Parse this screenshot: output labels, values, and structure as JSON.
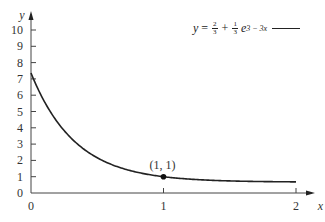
{
  "chart_data": {
    "type": "line",
    "title": "",
    "xlabel": "x",
    "ylabel": "y",
    "xlim": [
      0,
      2
    ],
    "ylim": [
      0,
      10
    ],
    "x_ticks": [
      "0",
      "1",
      "2"
    ],
    "y_ticks": [
      "0",
      "1",
      "2",
      "3",
      "4",
      "5",
      "6",
      "7",
      "8",
      "9",
      "10"
    ],
    "grid": false,
    "legend_position": "top-right",
    "series": [
      {
        "name": "y = 2/3 + 1/3 e^(3 - 3x)",
        "x": [
          0,
          0.1,
          0.2,
          0.3,
          0.4,
          0.5,
          0.6,
          0.7,
          0.8,
          0.9,
          1.0,
          1.2,
          1.4,
          1.6,
          1.8,
          2.0
        ],
        "values": [
          7.36,
          5.63,
          4.34,
          3.38,
          2.67,
          2.16,
          1.73,
          1.47,
          1.27,
          1.12,
          1.0,
          0.85,
          0.77,
          0.72,
          0.69,
          0.68
        ]
      }
    ],
    "annotations": [
      {
        "text": "(1, 1)",
        "x": 1,
        "y": 1,
        "marker": "dot"
      }
    ]
  },
  "legend": {
    "y": "y",
    "eq": "=",
    "frac1_num": "2",
    "frac1_den": "3",
    "plus": "+",
    "frac2_num": "1",
    "frac2_den": "3",
    "e": "e",
    "exponent": "3 − 3x"
  },
  "point_label": "(1, 1)"
}
